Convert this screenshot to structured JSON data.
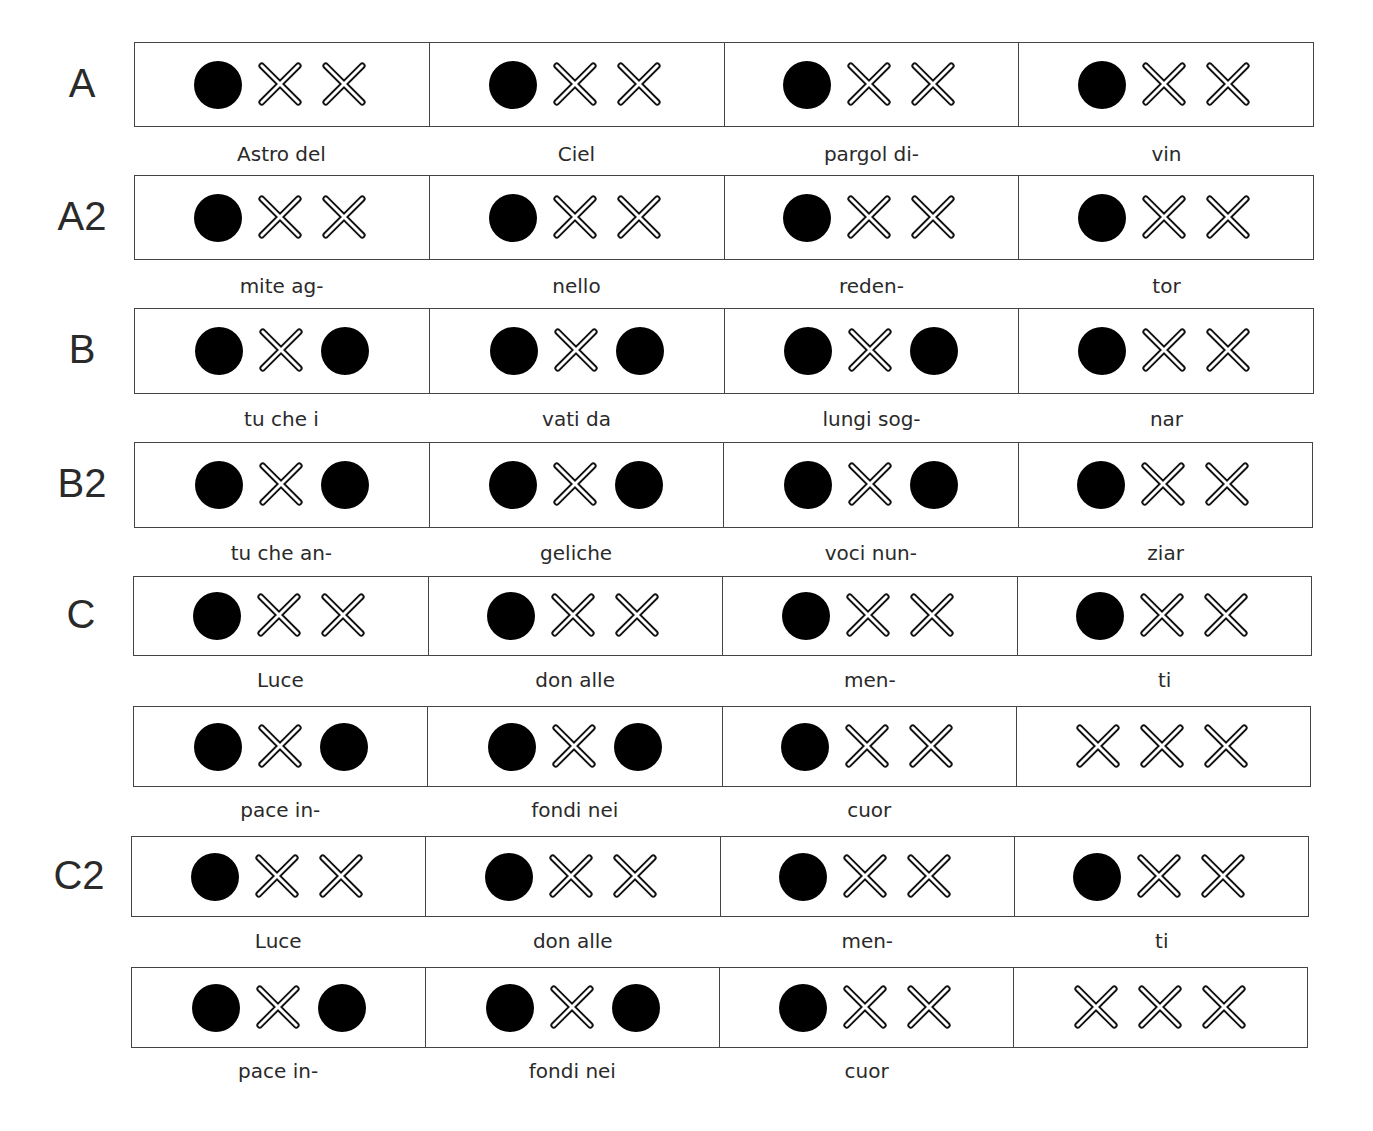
{
  "symbols": {
    "dot": "filled-circle (strong beat / clap)",
    "x": "outlined X (rest)"
  },
  "colors": {
    "ink": "#000000",
    "border": "#444444",
    "text": "#2a2a2a",
    "background": "#ffffff"
  },
  "rows": [
    {
      "label": "A",
      "cells": [
        [
          "dot",
          "x",
          "x"
        ],
        [
          "dot",
          "x",
          "x"
        ],
        [
          "dot",
          "x",
          "x"
        ],
        [
          "dot",
          "x",
          "x"
        ]
      ],
      "lyrics": [
        "Astro del",
        "Ciel",
        "pargol di-",
        "vin"
      ]
    },
    {
      "label": "A2",
      "cells": [
        [
          "dot",
          "x",
          "x"
        ],
        [
          "dot",
          "x",
          "x"
        ],
        [
          "dot",
          "x",
          "x"
        ],
        [
          "dot",
          "x",
          "x"
        ]
      ],
      "lyrics": [
        "mite ag-",
        "nello",
        "reden-",
        "tor"
      ]
    },
    {
      "label": "B",
      "cells": [
        [
          "dot",
          "x",
          "dot"
        ],
        [
          "dot",
          "x",
          "dot"
        ],
        [
          "dot",
          "x",
          "dot"
        ],
        [
          "dot",
          "x",
          "x"
        ]
      ],
      "lyrics": [
        "tu che i",
        "vati da",
        "lungi sog-",
        "nar"
      ]
    },
    {
      "label": "B2",
      "cells": [
        [
          "dot",
          "x",
          "dot"
        ],
        [
          "dot",
          "x",
          "dot"
        ],
        [
          "dot",
          "x",
          "dot"
        ],
        [
          "dot",
          "x",
          "x"
        ]
      ],
      "lyrics": [
        "tu che an-",
        "geliche",
        "voci nun-",
        "ziar"
      ]
    },
    {
      "label": "C",
      "cells": [
        [
          "dot",
          "x",
          "x"
        ],
        [
          "dot",
          "x",
          "x"
        ],
        [
          "dot",
          "x",
          "x"
        ],
        [
          "dot",
          "x",
          "x"
        ]
      ],
      "lyrics": [
        "Luce",
        "don alle",
        "men-",
        "ti"
      ]
    },
    {
      "label": "",
      "cells": [
        [
          "dot",
          "x",
          "dot"
        ],
        [
          "dot",
          "x",
          "dot"
        ],
        [
          "dot",
          "x",
          "x"
        ],
        [
          "x",
          "x",
          "x"
        ]
      ],
      "lyrics": [
        "pace in-",
        "fondi nei",
        "cuor",
        ""
      ]
    },
    {
      "label": "C2",
      "cells": [
        [
          "dot",
          "x",
          "x"
        ],
        [
          "dot",
          "x",
          "x"
        ],
        [
          "dot",
          "x",
          "x"
        ],
        [
          "dot",
          "x",
          "x"
        ]
      ],
      "lyrics": [
        "Luce",
        "don alle",
        "men-",
        "ti"
      ]
    },
    {
      "label": "",
      "cells": [
        [
          "dot",
          "x",
          "dot"
        ],
        [
          "dot",
          "x",
          "dot"
        ],
        [
          "dot",
          "x",
          "x"
        ],
        [
          "x",
          "x",
          "x"
        ]
      ],
      "lyrics": [
        "pace in-",
        "fondi nei",
        "cuor",
        ""
      ]
    }
  ]
}
